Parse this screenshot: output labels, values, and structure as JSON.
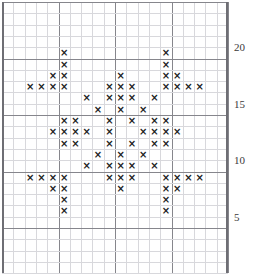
{
  "chart_data": {
    "type": "heatmap",
    "title": "",
    "xlabel": "",
    "ylabel": "",
    "grid": true,
    "legend": null,
    "columns": 20,
    "rows": 24,
    "cell_size_px": 11.3,
    "bold_gridline_interval": 5,
    "row_axis_labels": [
      {
        "value": "20",
        "row_line": 20
      },
      {
        "value": "15",
        "row_line": 15
      },
      {
        "value": "10",
        "row_line": 10
      },
      {
        "value": "5",
        "row_line": 5
      }
    ],
    "symbol": "×",
    "symbol_color": "#1c1c1c",
    "grid_line_color": "#d8d8dc",
    "bold_grid_line_color": "#86868c",
    "background_color": "#ffffff",
    "stitch_rows": [
      {
        "row": 0,
        "cols": []
      },
      {
        "row": 1,
        "cols": []
      },
      {
        "row": 2,
        "cols": []
      },
      {
        "row": 3,
        "cols": []
      },
      {
        "row": 4,
        "cols": [
          5,
          14
        ]
      },
      {
        "row": 5,
        "cols": [
          5,
          14
        ]
      },
      {
        "row": 6,
        "cols": [
          4,
          5,
          10,
          14,
          15
        ]
      },
      {
        "row": 7,
        "cols": [
          2,
          3,
          4,
          5,
          9,
          10,
          11,
          14,
          15,
          16,
          17
        ]
      },
      {
        "row": 8,
        "cols": [
          7,
          9,
          10,
          11,
          13
        ]
      },
      {
        "row": 9,
        "cols": [
          8,
          10,
          12
        ]
      },
      {
        "row": 10,
        "cols": [
          5,
          6,
          9,
          11,
          13,
          14
        ]
      },
      {
        "row": 11,
        "cols": [
          4,
          5,
          6,
          7,
          9,
          12,
          13,
          14,
          15
        ]
      },
      {
        "row": 12,
        "cols": [
          5,
          6,
          9,
          11,
          13,
          14
        ]
      },
      {
        "row": 13,
        "cols": [
          8,
          10,
          12
        ]
      },
      {
        "row": 14,
        "cols": [
          7,
          9,
          10,
          11,
          13
        ]
      },
      {
        "row": 15,
        "cols": [
          2,
          3,
          4,
          5,
          9,
          10,
          11,
          14,
          15,
          16,
          17
        ]
      },
      {
        "row": 16,
        "cols": [
          4,
          5,
          10,
          14,
          15
        ]
      },
      {
        "row": 17,
        "cols": [
          5,
          14
        ]
      },
      {
        "row": 18,
        "cols": [
          5,
          14
        ]
      },
      {
        "row": 19,
        "cols": []
      },
      {
        "row": 20,
        "cols": []
      },
      {
        "row": 21,
        "cols": []
      },
      {
        "row": 22,
        "cols": []
      },
      {
        "row": 23,
        "cols": []
      }
    ]
  }
}
